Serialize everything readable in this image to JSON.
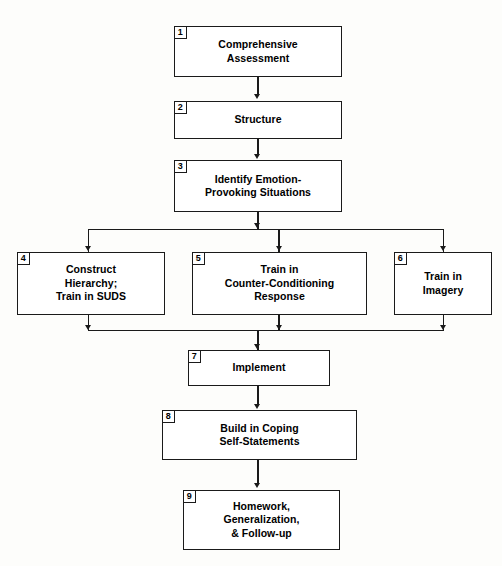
{
  "diagram": {
    "background_color": "#fdfdfb",
    "line_color": "#1a1a1a",
    "box_fill": "#ffffff",
    "text_color": "#000000",
    "nodes": [
      {
        "number": "1",
        "label": "Comprehensive\nAssessment"
      },
      {
        "number": "2",
        "label": "Structure"
      },
      {
        "number": "3",
        "label": "Identify Emotion-\nProvoking Situations"
      },
      {
        "number": "4",
        "label": "Construct\nHierarchy;\nTrain in SUDS"
      },
      {
        "number": "5",
        "label": "Train in\nCounter-Conditioning\nResponse"
      },
      {
        "number": "6",
        "label": "Train in\nImagery"
      },
      {
        "number": "7",
        "label": "Implement"
      },
      {
        "number": "8",
        "label": "Build in Coping\nSelf-Statements"
      },
      {
        "number": "9",
        "label": "Homework,\nGeneralization,\n& Follow-up"
      }
    ]
  }
}
